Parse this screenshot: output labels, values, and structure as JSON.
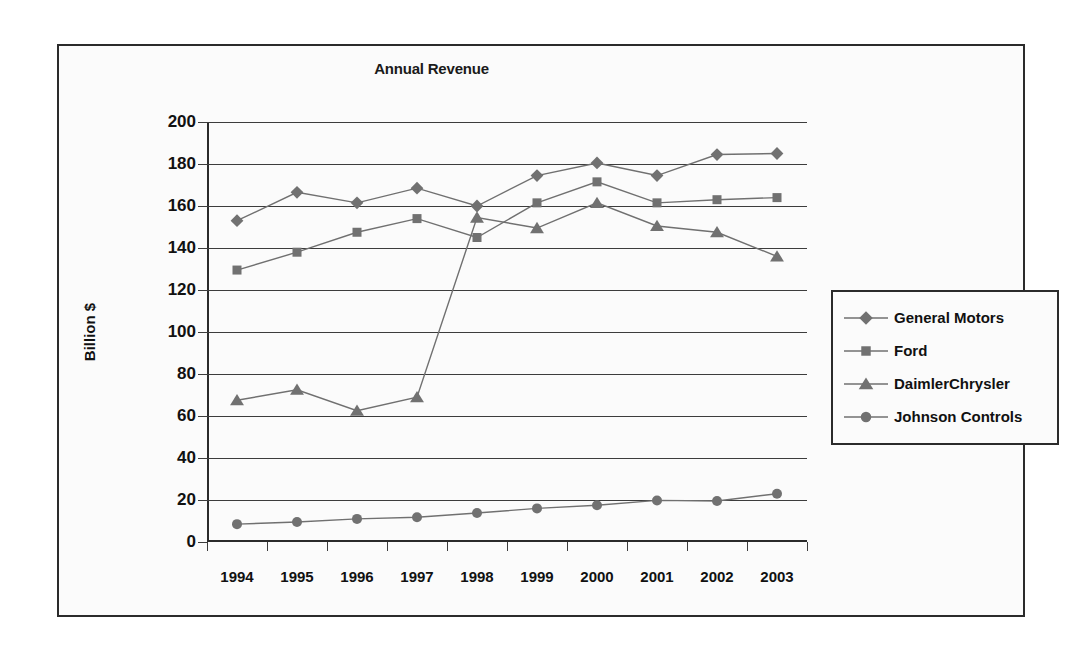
{
  "chart_data": {
    "type": "line",
    "title": "Annual Revenue",
    "xlabel": "",
    "ylabel": "Billion $",
    "categories": [
      "1994",
      "1995",
      "1996",
      "1997",
      "1998",
      "1999",
      "2000",
      "2001",
      "2002",
      "2003"
    ],
    "ylim": [
      0,
      200
    ],
    "y_ticks": [
      0,
      20,
      40,
      60,
      80,
      100,
      120,
      140,
      160,
      180,
      200
    ],
    "grid": "horizontal",
    "legend_position": "right",
    "series": [
      {
        "name": "General Motors",
        "marker": "diamond",
        "color": "#717171",
        "values": [
          153,
          166.5,
          161.5,
          168.5,
          160,
          174.5,
          180.5,
          174.5,
          184.5,
          185
        ]
      },
      {
        "name": "Ford",
        "marker": "square",
        "color": "#717171",
        "values": [
          129.5,
          138,
          147.5,
          154,
          145,
          161.5,
          171.5,
          161.5,
          163,
          164
        ]
      },
      {
        "name": "DaimlerChrysler",
        "marker": "triangle",
        "color": "#717171",
        "values": [
          67.5,
          72.5,
          62.5,
          69,
          154.5,
          149.5,
          161.5,
          150.5,
          147.5,
          136
        ]
      },
      {
        "name": "Johnson Controls",
        "marker": "circle",
        "color": "#717171",
        "values": [
          8.5,
          9.5,
          11,
          11.8,
          13.8,
          16,
          17.5,
          19.8,
          19.5,
          23
        ]
      }
    ]
  },
  "legend": {
    "items": [
      {
        "label": "General Motors",
        "marker": "diamond"
      },
      {
        "label": "Ford",
        "marker": "square"
      },
      {
        "label": "DaimlerChrysler",
        "marker": "triangle"
      },
      {
        "label": "Johnson Controls",
        "marker": "circle"
      }
    ]
  },
  "colors": {
    "series": "#717171",
    "line": "#707070",
    "axis": "#2b2b2b",
    "grid": "#3c3c3c",
    "text": "#111111",
    "plot_background": "#fbfbfb"
  }
}
